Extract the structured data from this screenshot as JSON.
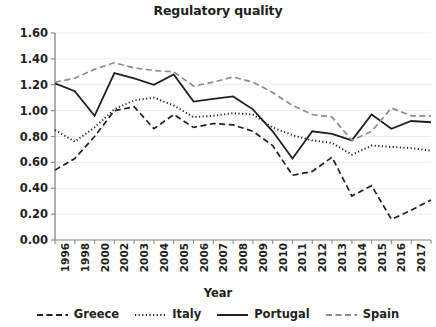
{
  "chart_data": {
    "type": "line",
    "title": "Regulatory quality",
    "xlabel": "Year",
    "ylabel": "",
    "grid": true,
    "legend_position": "bottom",
    "ylim": [
      0.0,
      1.6
    ],
    "ytick_labels": [
      "1.60",
      "1.40",
      "1.20",
      "1.00",
      "0.80",
      "0.60",
      "0.40",
      "0.20",
      "0.00"
    ],
    "ytick_values": [
      1.6,
      1.4,
      1.2,
      1.0,
      0.8,
      0.6,
      0.4,
      0.2,
      0.0
    ],
    "categories": [
      "1996",
      "1998",
      "2000",
      "2002",
      "2003",
      "2004",
      "2005",
      "2006",
      "2007",
      "2008",
      "2009",
      "2010",
      "2011",
      "2012",
      "2013",
      "2014",
      "2015",
      "2016",
      "2017",
      "2018"
    ],
    "series": [
      {
        "name": "Greece",
        "style": "dashed",
        "color": "#231f20",
        "values": [
          0.54,
          0.63,
          0.8,
          1.0,
          1.03,
          0.86,
          0.97,
          0.87,
          0.9,
          0.89,
          0.84,
          0.73,
          0.5,
          0.53,
          0.64,
          0.34,
          0.42,
          0.16,
          0.23,
          0.31
        ]
      },
      {
        "name": "Italy",
        "style": "dotted",
        "color": "#231f20",
        "values": [
          0.85,
          0.76,
          0.87,
          1.01,
          1.08,
          1.1,
          1.04,
          0.95,
          0.96,
          0.98,
          0.97,
          0.87,
          0.81,
          0.77,
          0.75,
          0.66,
          0.73,
          0.72,
          0.71,
          0.69
        ]
      },
      {
        "name": "Portugal",
        "style": "solid",
        "color": "#231f20",
        "values": [
          1.21,
          1.15,
          0.96,
          1.29,
          1.25,
          1.2,
          1.28,
          1.07,
          1.09,
          1.11,
          1.01,
          0.84,
          0.63,
          0.84,
          0.82,
          0.77,
          0.97,
          0.86,
          0.92,
          0.91
        ]
      },
      {
        "name": "Spain",
        "style": "dashed",
        "color": "#8c8c8c",
        "values": [
          1.22,
          1.25,
          1.32,
          1.37,
          1.33,
          1.31,
          1.3,
          1.19,
          1.22,
          1.26,
          1.22,
          1.14,
          1.04,
          0.97,
          0.95,
          0.77,
          0.84,
          1.02,
          0.96,
          0.96
        ]
      }
    ]
  },
  "legend": {
    "items": [
      {
        "label": "Greece",
        "icon": "dashed-line-swatch"
      },
      {
        "label": "Italy",
        "icon": "dotted-line-swatch"
      },
      {
        "label": "Portugal",
        "icon": "solid-line-swatch"
      },
      {
        "label": "Spain",
        "icon": "dashed-line-swatch"
      }
    ]
  }
}
